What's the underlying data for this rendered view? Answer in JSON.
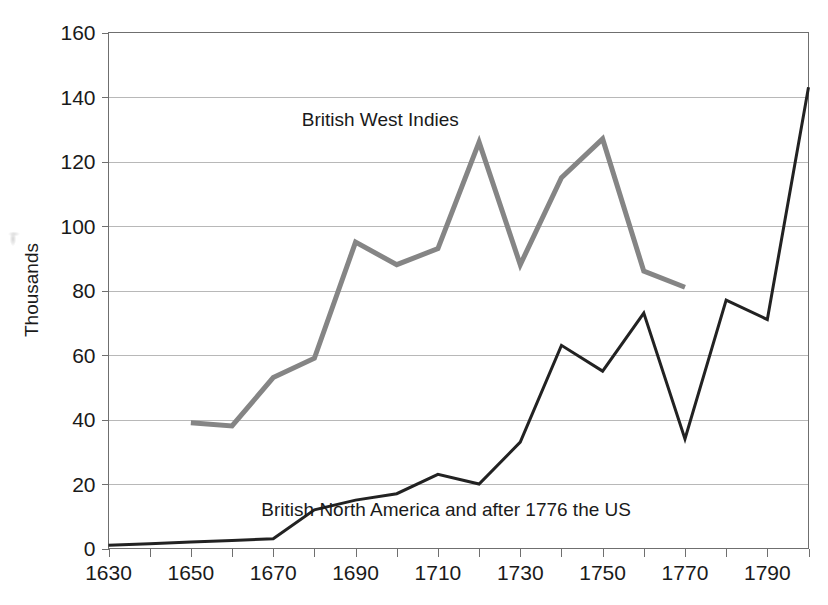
{
  "chart_data": {
    "type": "line",
    "title": "",
    "subtitle": "",
    "xlabel": "",
    "ylabel": "Thousands",
    "xlim": [
      1630,
      1800
    ],
    "ylim": [
      0,
      160
    ],
    "grid": true,
    "legend_position": "inline-annotations",
    "x_tick_labels": [
      "1630",
      "1650",
      "1670",
      "1690",
      "1710",
      "1730",
      "1750",
      "1770",
      "1790"
    ],
    "x_tick_values": [
      1630,
      1650,
      1670,
      1690,
      1710,
      1730,
      1750,
      1770,
      1790
    ],
    "x_minor_ticks": [
      1640,
      1660,
      1680,
      1700,
      1720,
      1740,
      1760,
      1780,
      1800
    ],
    "y_tick_labels": [
      "0",
      "20",
      "40",
      "60",
      "80",
      "100",
      "120",
      "140",
      "160"
    ],
    "y_tick_values": [
      0,
      20,
      40,
      60,
      80,
      100,
      120,
      140,
      160
    ],
    "series": [
      {
        "name": "British West Indies",
        "color": "#858585",
        "linewidth": 5,
        "label_text": "British West Indies",
        "label_x": 1696,
        "label_y": 131,
        "x": [
          1650,
          1660,
          1670,
          1680,
          1690,
          1700,
          1710,
          1720,
          1730,
          1740,
          1750,
          1760,
          1770
        ],
        "values": [
          39,
          38,
          53,
          59,
          95,
          88,
          93,
          126,
          88,
          115,
          127,
          86,
          81
        ]
      },
      {
        "name": "British North America and after 1776 the US",
        "color": "#222222",
        "linewidth": 3,
        "label_text": "British North America and after 1776 the US",
        "label_x": 1712,
        "label_y": 10,
        "x": [
          1630,
          1640,
          1650,
          1660,
          1670,
          1680,
          1690,
          1700,
          1710,
          1720,
          1730,
          1740,
          1750,
          1760,
          1770,
          1780,
          1790,
          1800
        ],
        "values": [
          1,
          1.5,
          2,
          2.5,
          3,
          12,
          15,
          17,
          23,
          20,
          33,
          63,
          55,
          73,
          34,
          77,
          71,
          143
        ]
      }
    ]
  }
}
